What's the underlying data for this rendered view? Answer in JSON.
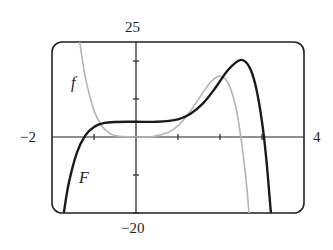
{
  "chart_data": {
    "type": "line",
    "title": "",
    "xlabel": "",
    "ylabel": "",
    "xlim": [
      -2,
      4
    ],
    "ylim": [
      -20,
      25
    ],
    "x_tick_step": 1,
    "y_tick_step": 10,
    "grid": false,
    "legend": "inline labels",
    "axis_labels": {
      "x_min": "−2",
      "x_max": "4",
      "y_max": "25",
      "y_min": "−20"
    },
    "series": [
      {
        "name": "f",
        "style": "light gray, thin",
        "color": "#b4b4b4",
        "formula_estimate": "f(x) = 5x^4 - 2x^5",
        "x": [
          -1.34,
          -1.2,
          -1.0,
          -0.8,
          -0.6,
          -0.4,
          0,
          0.4,
          0.8,
          1.0,
          1.2,
          1.4,
          1.6,
          1.8,
          2.0,
          2.2,
          2.4,
          2.6,
          2.69
        ],
        "y": [
          25,
          15.35,
          7,
          2.7,
          0.8,
          0.15,
          0,
          0.11,
          1.39,
          3,
          5.39,
          8.45,
          11.8,
          14.7,
          16,
          14.06,
          6.6,
          -9.1,
          -20
        ]
      },
      {
        "name": "F",
        "style": "black, thick",
        "color": "#1a1a1a",
        "formula_estimate": "F(x) = x^6... antiderivative of f: x^5 - x^6/3 + 4",
        "x": [
          -1.72,
          -1.6,
          -1.4,
          -1.2,
          -1.0,
          -0.8,
          -0.5,
          0,
          0.5,
          1.0,
          1.3,
          1.6,
          1.9,
          2.2,
          2.5,
          2.7,
          2.85,
          3.0,
          3.1,
          3.2,
          3.21
        ],
        "y": [
          -20,
          -12.1,
          -3.89,
          0.51,
          2.67,
          3.59,
          3.96,
          4,
          4.03,
          4.67,
          6.1,
          8.9,
          13.08,
          17.75,
          20.28,
          18.4,
          13.4,
          4,
          -5.5,
          -18.4,
          -20
        ]
      }
    ],
    "annotations": [
      {
        "text": "f",
        "x": -1.45,
        "y": 14
      },
      {
        "text": "F",
        "x": -1.2,
        "y": -10.5
      }
    ]
  },
  "labels": {
    "y_top": "25",
    "y_bottom": "−20",
    "x_left": "−2",
    "x_right": "4",
    "curve_f": "f",
    "curve_F": "F"
  }
}
